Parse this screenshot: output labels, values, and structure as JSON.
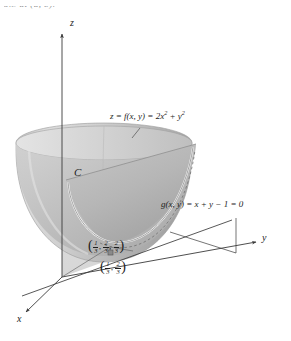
{
  "figure": {
    "kind": "3d-surface-diagram",
    "header_fragment": "5.3 at (a, b).",
    "axes": [
      {
        "name": "z-axis",
        "label": "z"
      },
      {
        "name": "y-axis",
        "label": "y"
      },
      {
        "name": "x-axis",
        "label": "x"
      }
    ],
    "labels": {
      "surface_prefix": "z = f(x, y) = 2x",
      "surface_exponent_1": "2",
      "surface_middle": " + y",
      "surface_exponent_2": "2",
      "surface_full": "z = f(x, y) = 2x² + y²",
      "constraint": "g(x, y) = x + y − 1 = 0",
      "curve": "C"
    },
    "points": [
      {
        "name": "minimum-point-3d",
        "text": "(1/3, 2/3, 2/3)",
        "coords": [
          "1/3",
          "2/3",
          "2/3"
        ],
        "numerators": [
          "1",
          "2",
          "2"
        ],
        "denominators": [
          "3",
          "3",
          "3"
        ]
      },
      {
        "name": "minimum-point-2d",
        "text": "(1/3, 2/3)",
        "coords": [
          "1/3",
          "2/3"
        ],
        "numerators": [
          "1",
          "2"
        ],
        "denominators": [
          "3",
          "3"
        ]
      }
    ],
    "colors": {
      "surface_light": "#d8d8d8",
      "surface_mid": "#bdbdbd",
      "surface_dark": "#a8a8a8",
      "plane": "#c9c9c9",
      "stroke": "#4a4a4a",
      "text": "#1d1d1d",
      "background": "#ffffff"
    }
  }
}
